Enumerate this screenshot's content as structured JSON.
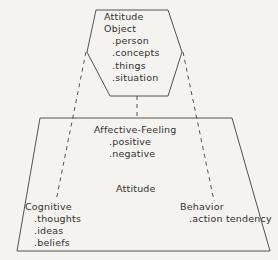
{
  "diagram": {
    "colors": {
      "background": "#f4f3ef",
      "stroke": "#55524d",
      "text": "#33312e"
    },
    "attitude_object": {
      "heading_line_1": "Attitude",
      "heading_line_2": "Object",
      "items": [
        ".person",
        ".concepts",
        ".things",
        ".situation"
      ]
    },
    "affective": {
      "heading": "Affective-Feeling",
      "items": [
        ".positive",
        ".negative"
      ]
    },
    "center_label": "Attitude",
    "cognitive": {
      "heading": "Cognitive",
      "items": [
        ".thoughts",
        ".ideas",
        ".beliefs"
      ]
    },
    "behavior": {
      "heading": "Behavior",
      "items": [
        ".action tendency"
      ]
    }
  }
}
